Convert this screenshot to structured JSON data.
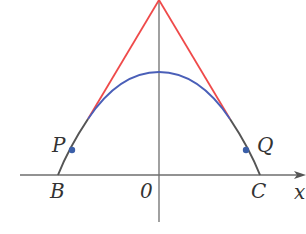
{
  "figure": {
    "labels": {
      "P": "P",
      "Q": "Q",
      "B": "B",
      "C": "C",
      "origin": "0",
      "x_axis": "x"
    },
    "colors": {
      "tangent_lines": "#ef4a4a",
      "curve": "#4a5fb8",
      "overlap": "#555555",
      "axes": "#6e6e6e",
      "points": "#3b5fa8",
      "text": "#333333"
    },
    "elements": [
      "y-axis (vertical line through origin)",
      "x-axis with arrow",
      "downward parabola-like blue curve through B and C",
      "two red tangent lines meeting at top of y-axis",
      "points P and Q on the curve"
    ]
  }
}
